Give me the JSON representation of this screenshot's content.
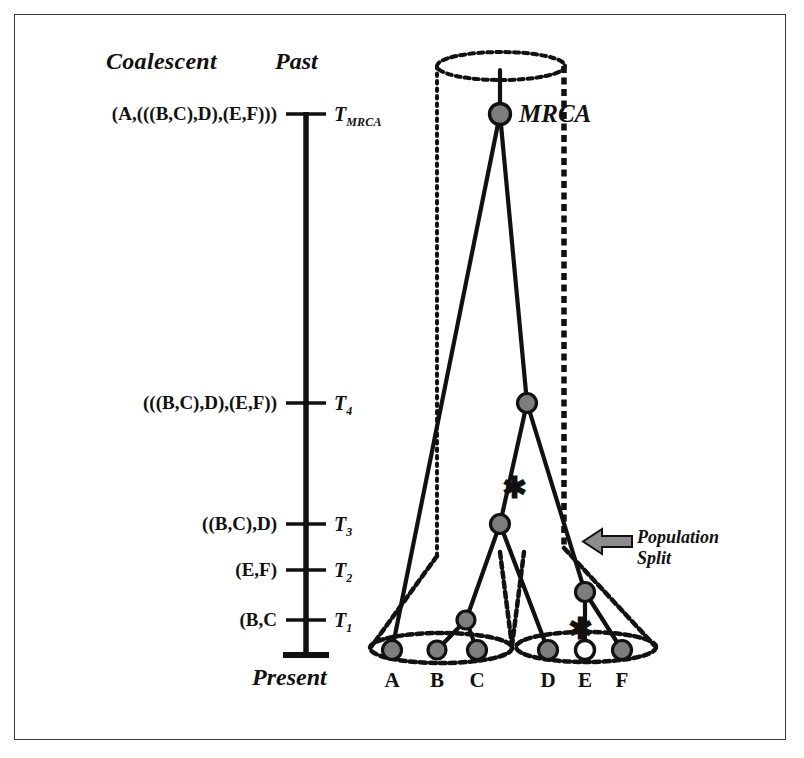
{
  "figure": {
    "headers": {
      "coalescent": "Coalescent",
      "past": "Past",
      "present": "Present"
    },
    "axis": {
      "ticks": [
        {
          "id": "tmrca",
          "topology": "(A,(((B,C),D),(E,F)))",
          "time_base": "T",
          "time_sub": "MRCA",
          "y": 114
        },
        {
          "id": "t4",
          "topology": "(((B,C),D),(E,F))",
          "time_base": "T",
          "time_sub": "4",
          "y": 403
        },
        {
          "id": "t3",
          "topology": "((B,C),D)",
          "time_base": "T",
          "time_sub": "3",
          "y": 524
        },
        {
          "id": "t2",
          "topology": "(E,F)",
          "time_base": "T",
          "time_sub": "2",
          "y": 570
        },
        {
          "id": "t1",
          "topology": "(B,C",
          "time_base": "T",
          "time_sub": "1",
          "y": 620
        }
      ]
    },
    "annotations": {
      "mrca_label": "MRCA",
      "population_split_line1": "Population",
      "population_split_line2": "Split",
      "mutation_marker": "✱"
    },
    "tips": [
      {
        "label": "A",
        "x": 392,
        "filled": true
      },
      {
        "label": "B",
        "x": 437,
        "filled": true
      },
      {
        "label": "C",
        "x": 477,
        "filled": true
      },
      {
        "label": "D",
        "x": 548,
        "filled": true
      },
      {
        "label": "E",
        "x": 585,
        "filled": false
      },
      {
        "label": "F",
        "x": 622,
        "filled": true
      }
    ],
    "nodes": [
      {
        "id": "mrca",
        "x": 500,
        "y": 114
      },
      {
        "id": "t4",
        "x": 527,
        "y": 403
      },
      {
        "id": "t3",
        "x": 500,
        "y": 524
      },
      {
        "id": "t2",
        "x": 585,
        "y": 592
      },
      {
        "id": "t1",
        "x": 466,
        "y": 620
      }
    ],
    "mutations": [
      {
        "id": "mut-upper",
        "x": 512,
        "y": 487
      },
      {
        "id": "mut-lower",
        "x": 578,
        "y": 628
      }
    ],
    "colors": {
      "node_fill": "#7d7d7d",
      "open_node_fill": "#ffffff",
      "stroke": "#111111",
      "arrow_fill": "#8c8c8c",
      "frame": "#3a3a38"
    }
  }
}
